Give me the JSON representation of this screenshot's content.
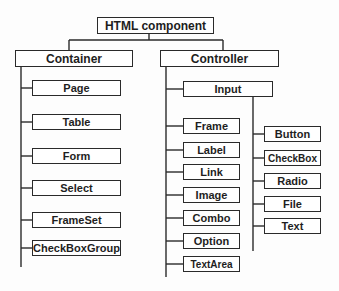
{
  "diagram": {
    "type": "tree",
    "root": {
      "label": "HTML component"
    },
    "container": {
      "label": "Container",
      "children": [
        "Page",
        "Table",
        "Form",
        "Select",
        "FrameSet",
        "CheckBoxGroup"
      ]
    },
    "controller": {
      "label": "Controller",
      "input": {
        "label": "Input",
        "children": [
          "Button",
          "CheckBox",
          "Radio",
          "File",
          "Text"
        ]
      },
      "children": [
        "Frame",
        "Label",
        "Link",
        "Image",
        "Combo",
        "Option",
        "TextArea"
      ]
    },
    "colors": {
      "line": "#2a2a2a",
      "box_fill": "#ffffff",
      "text": "#1e1e1e"
    }
  }
}
